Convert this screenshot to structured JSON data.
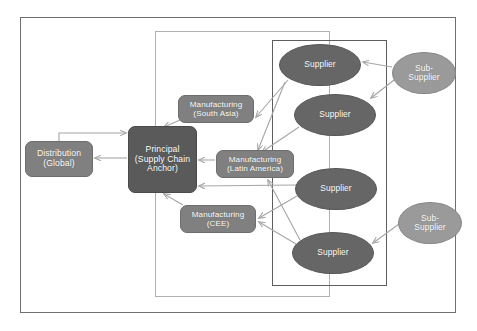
{
  "diagram": {
    "frames": [
      {
        "name": "outer-frame",
        "label": ""
      },
      {
        "name": "mid-frame",
        "label": ""
      },
      {
        "name": "supplier-frame",
        "label": ""
      }
    ],
    "nodes": [
      {
        "id": "distribution",
        "label": "Distribution\n(Global)",
        "shape": "rounded-rect",
        "fill": "#808080",
        "text_color": "#ffffff"
      },
      {
        "id": "principal",
        "label": "Principal\n(Supply Chain\nAnchor)",
        "shape": "rounded-rect",
        "fill": "#5a5a5a",
        "text_color": "#ffffff"
      },
      {
        "id": "mfg_south_asia",
        "label": "Manufacturing\n(South Asia)",
        "shape": "rounded-rect",
        "fill": "#808080",
        "text_color": "#ffffff"
      },
      {
        "id": "mfg_latin_america",
        "label": "Manufacturing\n(Latin America)",
        "shape": "rounded-rect",
        "fill": "#808080",
        "text_color": "#ffffff"
      },
      {
        "id": "mfg_cee",
        "label": "Manufacturing\n(CEE)",
        "shape": "rounded-rect",
        "fill": "#808080",
        "text_color": "#ffffff"
      },
      {
        "id": "supplier_1",
        "label": "Supplier",
        "shape": "ellipse",
        "fill": "#666666",
        "text_color": "#ffffff"
      },
      {
        "id": "supplier_2",
        "label": "Supplier",
        "shape": "ellipse",
        "fill": "#666666",
        "text_color": "#ffffff"
      },
      {
        "id": "supplier_3",
        "label": "Supplier",
        "shape": "ellipse",
        "fill": "#666666",
        "text_color": "#ffffff"
      },
      {
        "id": "supplier_4",
        "label": "Supplier",
        "shape": "ellipse",
        "fill": "#666666",
        "text_color": "#ffffff"
      },
      {
        "id": "sub_supplier_1",
        "label": "Sub-\nSupplier",
        "shape": "ellipse",
        "fill": "#9a9a9a",
        "text_color": "#ffffff"
      },
      {
        "id": "sub_supplier_2",
        "label": "Sub-\nSupplier",
        "shape": "ellipse",
        "fill": "#9a9a9a",
        "text_color": "#ffffff"
      }
    ],
    "edges": [
      {
        "from": "distribution",
        "to": "principal",
        "label": "",
        "style": "elbow-arrow"
      },
      {
        "from": "principal",
        "to": "distribution",
        "label": "",
        "style": "arrow"
      },
      {
        "from": "mfg_south_asia",
        "to": "principal",
        "label": "",
        "style": "arrow"
      },
      {
        "from": "mfg_latin_america",
        "to": "principal",
        "label": "",
        "style": "arrow"
      },
      {
        "from": "mfg_cee",
        "to": "principal",
        "label": "",
        "style": "arrow"
      },
      {
        "from": "supplier_1",
        "to": "mfg_south_asia",
        "label": "",
        "style": "arrow"
      },
      {
        "from": "supplier_1",
        "to": "mfg_latin_america",
        "label": "",
        "style": "arrow"
      },
      {
        "from": "supplier_2",
        "to": "mfg_latin_america",
        "label": "",
        "style": "arrow"
      },
      {
        "from": "supplier_3",
        "to": "principal",
        "label": "",
        "style": "arrow"
      },
      {
        "from": "supplier_3",
        "to": "mfg_cee",
        "label": "",
        "style": "arrow"
      },
      {
        "from": "supplier_4",
        "to": "mfg_latin_america",
        "label": "",
        "style": "arrow"
      },
      {
        "from": "supplier_4",
        "to": "mfg_cee",
        "label": "",
        "style": "arrow"
      },
      {
        "from": "sub_supplier_1",
        "to": "supplier_1",
        "label": "",
        "style": "arrow"
      },
      {
        "from": "sub_supplier_1",
        "to": "supplier_2",
        "label": "",
        "style": "arrow"
      },
      {
        "from": "sub_supplier_2",
        "to": "supplier_4",
        "label": "",
        "style": "arrow"
      }
    ],
    "colors": {
      "node_dark": "#5a5a5a",
      "node_mid": "#808080",
      "ellipse_dark": "#666666",
      "ellipse_light": "#9a9a9a",
      "connector": "#a6a6a6",
      "outer_border": "#6f6f6f",
      "mid_border": "#b0b0b0",
      "supplier_border": "#5d5d5d",
      "background": "#ffffff"
    }
  }
}
